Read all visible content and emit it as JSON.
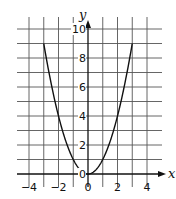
{
  "chart_data": {
    "type": "line",
    "title": "",
    "xlabel": "x",
    "ylabel": "y",
    "function": "y = x^2",
    "x": [
      -3,
      -2.5,
      -2,
      -1.5,
      -1,
      -0.5,
      0,
      0.5,
      1,
      1.5,
      2,
      2.5,
      3
    ],
    "series": [
      {
        "name": "y = x^2",
        "values": [
          9,
          6.25,
          4,
          2.25,
          1,
          0.25,
          0,
          0.25,
          1,
          2.25,
          4,
          6.25,
          9
        ]
      }
    ],
    "xlim": [
      -4.8,
      5
    ],
    "ylim": [
      0,
      10.8
    ],
    "x_ticks": [
      -4,
      -2,
      0,
      2,
      4
    ],
    "x_tick_labels": [
      "−4",
      "−2",
      "0",
      "2",
      "4"
    ],
    "y_ticks": [
      0,
      2,
      4,
      6,
      8,
      10
    ],
    "y_tick_labels": [
      "0",
      "2",
      "4",
      "6",
      "8",
      "10"
    ],
    "grid": true,
    "grid_step_x": 1,
    "grid_step_y": 1,
    "legend": null,
    "colors": {
      "curve": "#111111",
      "grid": "#555555",
      "axis": "#111111"
    }
  }
}
